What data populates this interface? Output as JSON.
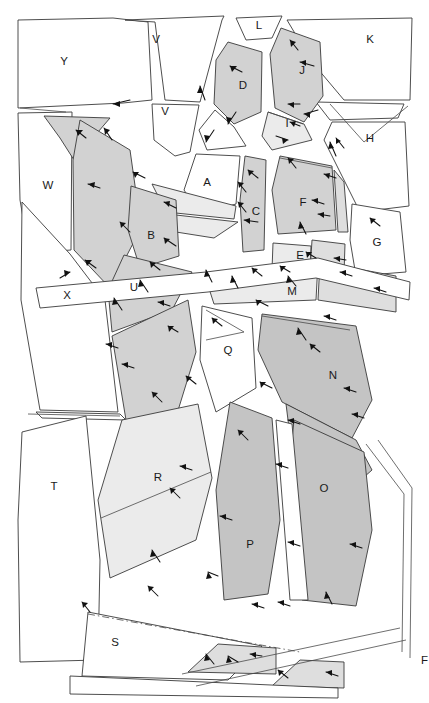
{
  "figure": {
    "name": "fault-block-map",
    "width": 429,
    "height": 703,
    "background": "#ffffff",
    "outline_color": "#3a3a3a"
  },
  "palette": {
    "white": "#ffffff",
    "light1": "#ebebeb",
    "light2": "#dedede",
    "mid1": "#d2d2d2",
    "mid2": "#c4c4c4",
    "dark1": "#b9b9b9",
    "line": "#3a3a3a",
    "arrow": "#111111",
    "label": "#1a1a1a"
  },
  "blocks": [
    {
      "id": "Y",
      "label": "Y",
      "fill": "white",
      "lx": 64,
      "ly": 62
    },
    {
      "id": "V1",
      "label": "V",
      "fill": "white",
      "lx": 156,
      "ly": 40
    },
    {
      "id": "V2",
      "label": "V",
      "fill": "white",
      "lx": 165,
      "ly": 112
    },
    {
      "id": "L",
      "label": "L",
      "fill": "white",
      "lx": 259,
      "ly": 26
    },
    {
      "id": "K",
      "label": "K",
      "fill": "white",
      "lx": 370,
      "ly": 40
    },
    {
      "id": "D",
      "label": "D",
      "fill": "mid1",
      "lx": 243,
      "ly": 86
    },
    {
      "id": "J",
      "label": "J",
      "fill": "mid1",
      "lx": 302,
      "ly": 71
    },
    {
      "id": "I",
      "label": "I",
      "fill": "light1",
      "lx": 287,
      "ly": 124
    },
    {
      "id": "H",
      "label": "H",
      "fill": "white",
      "lx": 370,
      "ly": 139
    },
    {
      "id": "W",
      "label": "W",
      "fill": "white",
      "lx": 48,
      "ly": 186
    },
    {
      "id": "A",
      "label": "A",
      "fill": "white",
      "lx": 207,
      "ly": 183
    },
    {
      "id": "C",
      "label": "C",
      "fill": "mid1",
      "lx": 256,
      "ly": 212
    },
    {
      "id": "F",
      "label": "F",
      "fill": "mid1",
      "lx": 303,
      "ly": 203
    },
    {
      "id": "B",
      "label": "B",
      "fill": "mid1",
      "lx": 151,
      "ly": 236
    },
    {
      "id": "E",
      "label": "E",
      "fill": "light1",
      "lx": 300,
      "ly": 256
    },
    {
      "id": "G",
      "label": "G",
      "fill": "white",
      "lx": 377,
      "ly": 243
    },
    {
      "id": "X",
      "label": "X",
      "fill": "white",
      "lx": 67,
      "ly": 296
    },
    {
      "id": "U",
      "label": "U",
      "fill": "mid1",
      "lx": 134,
      "ly": 288
    },
    {
      "id": "M",
      "label": "M",
      "fill": "light1",
      "lx": 292,
      "ly": 292
    },
    {
      "id": "Q",
      "label": "Q",
      "fill": "white",
      "lx": 228,
      "ly": 351
    },
    {
      "id": "N",
      "label": "N",
      "fill": "mid2",
      "lx": 333,
      "ly": 376
    },
    {
      "id": "R",
      "label": "R",
      "fill": "light1",
      "lx": 158,
      "ly": 478
    },
    {
      "id": "O",
      "label": "O",
      "fill": "mid2",
      "lx": 324,
      "ly": 489
    },
    {
      "id": "T",
      "label": "T",
      "fill": "white",
      "lx": 54,
      "ly": 487
    },
    {
      "id": "P",
      "label": "P",
      "fill": "mid2",
      "lx": 250,
      "ly": 545
    },
    {
      "id": "S",
      "label": "S",
      "fill": "white",
      "lx": 115,
      "ly": 643
    },
    {
      "id": "F2",
      "label": "F",
      "fill": "white",
      "lx": 423,
      "ly": 661
    }
  ],
  "annotation": {
    "arrow_count": 62,
    "arrow_meaning": "dip-direction-tick"
  }
}
